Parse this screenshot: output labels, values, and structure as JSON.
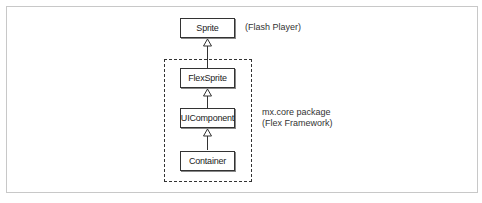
{
  "diagram": {
    "classes": [
      {
        "id": "sprite",
        "label": "Sprite"
      },
      {
        "id": "flexsprite",
        "label": "FlexSprite"
      },
      {
        "id": "uicomponent",
        "label": "UIComponent"
      },
      {
        "id": "container",
        "label": "Container"
      }
    ],
    "inheritance": [
      {
        "from": "Container",
        "to": "UIComponent"
      },
      {
        "from": "UIComponent",
        "to": "FlexSprite"
      },
      {
        "from": "FlexSprite",
        "to": "Sprite"
      }
    ],
    "annotations": {
      "flash_player": "(Flash Player)",
      "package_line1": "mx.core package",
      "package_line2": "(Flex Framework)"
    }
  }
}
